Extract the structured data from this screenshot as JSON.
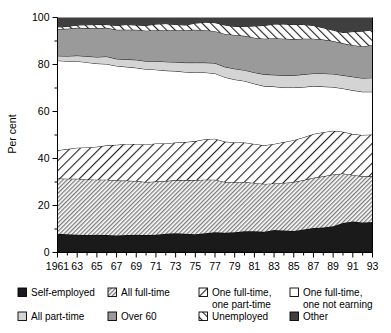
{
  "chart_data": {
    "type": "area",
    "title": "",
    "subtitle": "",
    "xlabel": "",
    "ylabel": "Per cent",
    "ylim": [
      0,
      100
    ],
    "yticks": [
      0,
      20,
      40,
      60,
      80,
      100
    ],
    "yticklabels": [
      "0",
      "20",
      "40",
      "60",
      "80",
      "100"
    ],
    "yminorticks": [
      10,
      30,
      50,
      70,
      90
    ],
    "xlim": [
      1961,
      1993
    ],
    "xticklabels": [
      "1961",
      "63",
      "65",
      "67",
      "69",
      "71",
      "73",
      "75",
      "77",
      "79",
      "81",
      "83",
      "85",
      "87",
      "89",
      "91",
      "93"
    ],
    "xtickvalues": [
      1961,
      1963,
      1965,
      1967,
      1969,
      1971,
      1973,
      1975,
      1977,
      1979,
      1981,
      1983,
      1985,
      1987,
      1989,
      1991,
      1993
    ],
    "grid": false,
    "legend_position": "below",
    "stacked": true,
    "x": [
      1961,
      1962,
      1963,
      1964,
      1965,
      1966,
      1967,
      1968,
      1969,
      1970,
      1971,
      1972,
      1973,
      1974,
      1975,
      1976,
      1977,
      1978,
      1979,
      1980,
      1981,
      1982,
      1983,
      1984,
      1985,
      1986,
      1987,
      1988,
      1989,
      1990,
      1991,
      1992,
      1993
    ],
    "series": [
      {
        "name": "Self-employed",
        "pattern": "solid-black",
        "color": "#1a1a1a",
        "values": [
          8.0,
          7.8,
          7.6,
          7.5,
          7.6,
          7.4,
          7.2,
          7.4,
          7.6,
          7.4,
          7.6,
          8.0,
          8.2,
          8.0,
          7.8,
          8.2,
          8.6,
          8.4,
          8.6,
          9.0,
          9.0,
          8.8,
          9.6,
          9.4,
          9.2,
          9.8,
          10.4,
          10.6,
          11.2,
          12.6,
          13.2,
          12.8,
          13.0
        ]
      },
      {
        "name": "All full-time",
        "pattern": "fine-dense-hatch",
        "color": "#c9c9c9",
        "values": [
          23.5,
          23.6,
          23.8,
          23.6,
          23.4,
          23.6,
          23.4,
          23.2,
          22.8,
          22.6,
          22.6,
          22.4,
          22.6,
          22.8,
          23.0,
          22.8,
          22.4,
          21.6,
          21.2,
          21.0,
          20.6,
          20.4,
          19.8,
          20.2,
          20.8,
          21.0,
          21.4,
          21.8,
          22.0,
          21.0,
          19.8,
          19.6,
          19.4
        ]
      },
      {
        "name": "One full-time, one part-time",
        "pattern": "wide-diagonal-hatch",
        "color": "#ffffff",
        "values": [
          12.0,
          12.6,
          13.2,
          13.6,
          14.0,
          14.6,
          15.2,
          15.6,
          15.8,
          16.0,
          16.2,
          16.0,
          16.0,
          16.2,
          16.6,
          17.2,
          17.4,
          17.2,
          17.0,
          16.8,
          16.6,
          16.4,
          16.8,
          17.4,
          17.8,
          18.2,
          18.6,
          18.8,
          18.6,
          17.8,
          17.4,
          17.6,
          17.8
        ]
      },
      {
        "name": "One full-time, one not earning",
        "pattern": "white",
        "color": "#ffffff",
        "values": [
          38.2,
          37.4,
          36.8,
          36.2,
          35.4,
          34.6,
          33.6,
          32.8,
          32.4,
          32.0,
          31.4,
          31.0,
          30.4,
          29.8,
          29.2,
          28.4,
          27.8,
          27.4,
          26.8,
          26.2,
          25.6,
          25.2,
          24.4,
          23.2,
          22.4,
          21.4,
          20.4,
          19.4,
          18.6,
          18.4,
          18.6,
          18.4,
          18.2
        ]
      },
      {
        "name": "All part-time",
        "pattern": "light-gray",
        "color": "#d4d4d4",
        "values": [
          2.0,
          2.2,
          2.4,
          2.6,
          2.8,
          3.2,
          3.0,
          3.2,
          3.4,
          3.4,
          3.6,
          3.8,
          3.8,
          4.0,
          4.2,
          4.2,
          4.4,
          4.4,
          4.6,
          4.6,
          4.8,
          5.0,
          5.0,
          5.2,
          5.2,
          5.4,
          5.4,
          5.6,
          5.6,
          5.6,
          5.8,
          5.8,
          6.0
        ]
      },
      {
        "name": "Over 60",
        "pattern": "medium-gray",
        "color": "#9a9a9a",
        "values": [
          11.4,
          11.6,
          11.8,
          12.0,
          12.2,
          12.2,
          12.4,
          12.6,
          12.8,
          13.0,
          13.2,
          13.4,
          13.6,
          13.8,
          14.0,
          13.8,
          13.6,
          14.0,
          14.4,
          14.6,
          14.8,
          15.2,
          15.6,
          15.6,
          15.4,
          15.2,
          14.8,
          14.4,
          14.0,
          13.6,
          13.4,
          13.6,
          13.8
        ]
      },
      {
        "name": "Unemployed",
        "pattern": "diagonal-hatch",
        "color": "#ffffff",
        "values": [
          0.9,
          1.0,
          1.2,
          1.4,
          1.6,
          1.4,
          1.8,
          2.2,
          2.0,
          2.2,
          2.6,
          2.8,
          2.4,
          2.2,
          2.8,
          3.4,
          3.6,
          3.8,
          3.6,
          4.0,
          5.0,
          5.6,
          6.0,
          6.2,
          6.2,
          6.0,
          5.6,
          5.0,
          4.6,
          4.6,
          5.8,
          6.4,
          6.6
        ]
      },
      {
        "name": "Other",
        "pattern": "dark-gray",
        "color": "#3f3f3f",
        "values": [
          4.0,
          3.8,
          3.2,
          3.1,
          3.0,
          3.0,
          3.4,
          3.0,
          3.2,
          3.4,
          2.8,
          2.6,
          3.0,
          3.2,
          2.4,
          2.0,
          2.2,
          3.2,
          3.8,
          3.8,
          3.6,
          3.4,
          2.8,
          2.8,
          3.0,
          3.0,
          3.4,
          4.4,
          5.4,
          6.4,
          6.0,
          5.8,
          5.2
        ]
      }
    ]
  },
  "axes": {
    "ylabel": "Per cent"
  },
  "legend": {
    "row1": [
      {
        "label": "Self-employed",
        "swatch": "solid-black"
      },
      {
        "label": "All full-time",
        "swatch": "fine-dense-hatch"
      },
      {
        "label": "One full-time,\none part-time",
        "line1": "One full-time,",
        "line2": "one part-time",
        "swatch": "wide-diagonal-hatch"
      },
      {
        "label": "One full-time,\none not earning",
        "line1": "One full-time,",
        "line2": "one not earning",
        "swatch": "white"
      }
    ],
    "row2": [
      {
        "label": "All part-time",
        "swatch": "light-gray"
      },
      {
        "label": "Over 60",
        "swatch": "medium-gray"
      },
      {
        "label": "Unemployed",
        "swatch": "diagonal-hatch"
      },
      {
        "label": "Other",
        "swatch": "dark-gray"
      }
    ]
  }
}
